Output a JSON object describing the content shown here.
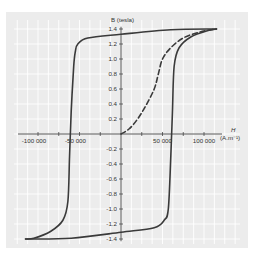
{
  "chart_data": {
    "type": "line",
    "title": "",
    "xlabel": "H (A.m⁻¹)",
    "xlabel_top": "H",
    "xlabel_unit": "(A.m⁻¹)",
    "ylabel": "B (tesla)",
    "xlim": [
      -115000,
      115000
    ],
    "ylim": [
      -1.4,
      1.4
    ],
    "x_ticks": [
      -100000,
      -75000,
      -50000,
      -25000,
      25000,
      50000,
      75000,
      100000
    ],
    "x_tick_labels": [
      {
        "value": -100000,
        "label": "-100 000"
      },
      {
        "value": -50000,
        "label": "-50 000"
      },
      {
        "value": 50000,
        "label": "50 000"
      },
      {
        "value": 100000,
        "label": "100 000"
      }
    ],
    "y_ticks": [
      1.4,
      1.2,
      1.0,
      0.8,
      0.6,
      0.4,
      0.2,
      -0.2,
      -0.4,
      -0.6,
      -0.8,
      -1.0,
      -1.2,
      -1.4
    ],
    "y_tick_labels": [
      "1.4",
      "1.2",
      "1.0",
      "0.8",
      "0.6",
      "0.4",
      "0.2",
      "-0.2",
      "-0.4",
      "-0.6",
      "-0.8",
      "-1.0",
      "-1.2",
      "-1.4"
    ],
    "grid": true,
    "legend": null,
    "series": [
      {
        "name": "hysteresis loop - descending branch",
        "style": "solid",
        "color": "#3a3a3a",
        "points": [
          [
            115000,
            1.4
          ],
          [
            60000,
            1.39
          ],
          [
            0,
            1.33
          ],
          [
            -40000,
            1.28
          ],
          [
            -52000,
            1.2
          ],
          [
            -55000,
            1.1
          ],
          [
            -57000,
            0.9
          ],
          [
            -60000,
            0.3
          ],
          [
            -62000,
            -0.3
          ],
          [
            -64000,
            -0.9
          ],
          [
            -70000,
            -1.15
          ],
          [
            -85000,
            -1.3
          ],
          [
            -105000,
            -1.39
          ],
          [
            -115000,
            -1.4
          ]
        ]
      },
      {
        "name": "hysteresis loop - ascending branch",
        "style": "solid",
        "color": "#3a3a3a",
        "points": [
          [
            -115000,
            -1.4
          ],
          [
            -60000,
            -1.39
          ],
          [
            0,
            -1.31
          ],
          [
            40000,
            -1.25
          ],
          [
            52000,
            -1.15
          ],
          [
            57000,
            -1.0
          ],
          [
            60000,
            -0.3
          ],
          [
            62000,
            0.3
          ],
          [
            64000,
            0.9
          ],
          [
            70000,
            1.15
          ],
          [
            85000,
            1.3
          ],
          [
            105000,
            1.38
          ],
          [
            115000,
            1.4
          ]
        ]
      },
      {
        "name": "initial magnetization curve",
        "style": "dashed",
        "color": "#3a3a3a",
        "points": [
          [
            0,
            0
          ],
          [
            10000,
            0.07
          ],
          [
            20000,
            0.2
          ],
          [
            30000,
            0.38
          ],
          [
            40000,
            0.6
          ],
          [
            45000,
            0.8
          ],
          [
            50000,
            1.0
          ],
          [
            60000,
            1.15
          ],
          [
            75000,
            1.28
          ],
          [
            95000,
            1.36
          ],
          [
            115000,
            1.4
          ]
        ]
      }
    ]
  },
  "colors": {
    "frame_bg": "#ececec",
    "grid": "#ffffff",
    "axis": "#444444",
    "curve": "#3a3a3a"
  }
}
